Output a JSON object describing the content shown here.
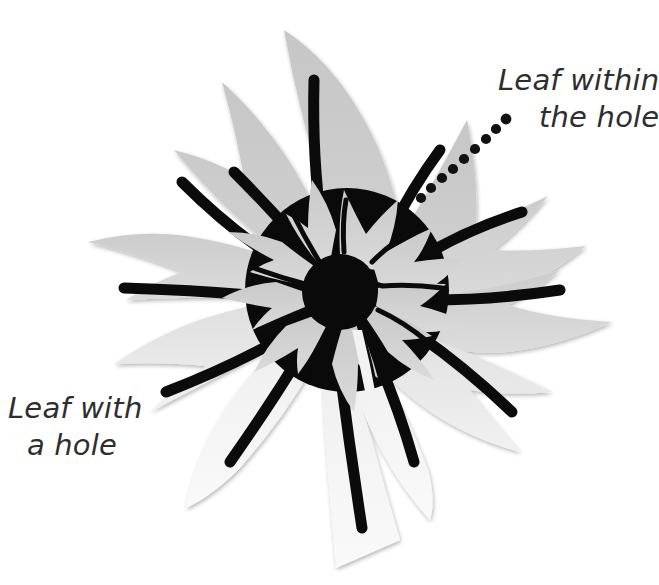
{
  "figure": {
    "type": "diagram",
    "background_color": "#ffffff",
    "palette": {
      "ink": "#000000",
      "text": "#2e2e2e",
      "petal_gray_dark": "#c9c9c9",
      "petal_gray_mid": "#d8d8d8",
      "petal_gray_light": "#ededed",
      "petal_white": "#f7f7f7",
      "disc_black": "#0a0a0a"
    }
  },
  "annotations": {
    "leaf_within_hole": {
      "line1": "Leaf within",
      "line2": "the hole",
      "leader": "dotted-leader-line",
      "dot_count": 9,
      "dot_color": "#111111"
    },
    "leaf_with_hole": {
      "line1": "Leaf with",
      "line2": "a hole",
      "leader": "none"
    }
  },
  "graphic": {
    "outer_petals": {
      "count": 11,
      "center_x": 347,
      "center_y": 292,
      "description": "pointed gray leaf-petals radiating outward with black curved mid-vein strokes"
    },
    "disc": {
      "label": "black-hole-disc",
      "center_x": 347,
      "center_y": 290,
      "radius": 102,
      "fill": "#0a0a0a"
    },
    "inner_petals": {
      "count": 11,
      "center_x": 340,
      "center_y": 292,
      "description": "light gray inner flower petals drawn inside the black hole"
    },
    "inner_core": {
      "label": "inner-black-core",
      "center_x": 340,
      "center_y": 292,
      "radius": 38,
      "fill": "#0a0a0a"
    },
    "tail_petal": {
      "label": "bottom-tail-petal",
      "description": "long narrow near-white petal extending to bottom with black vein"
    }
  }
}
